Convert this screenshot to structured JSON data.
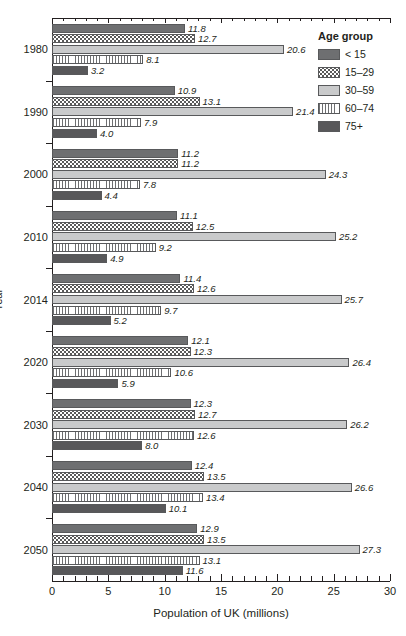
{
  "chart_data": {
    "type": "bar",
    "orientation": "horizontal",
    "grouped": true,
    "title": "",
    "xlabel": "Population of UK (millions)",
    "ylabel": "Year",
    "xlim": [
      0,
      30
    ],
    "xticks": [
      0,
      5,
      10,
      15,
      20,
      25,
      30
    ],
    "xtick_labels": [
      "0",
      "5",
      "10",
      "15",
      "20",
      "25",
      "30"
    ],
    "minor_tick_step": 1,
    "grid": false,
    "legend_title": "Age group",
    "legend_position": "top-right",
    "categories": [
      "1980",
      "1990",
      "2000",
      "2010",
      "2014",
      "2020",
      "2030",
      "2040",
      "2050"
    ],
    "series": [
      {
        "name": "< 15",
        "fill": "dark-gray-solid",
        "color": "#6e6f71",
        "values": [
          11.8,
          10.9,
          11.2,
          11.1,
          11.4,
          12.1,
          12.3,
          12.4,
          12.9
        ]
      },
      {
        "name": "15–29",
        "fill": "white-dotted",
        "color": "#ffffff",
        "values": [
          12.7,
          13.1,
          11.2,
          12.5,
          12.6,
          12.3,
          12.7,
          13.5,
          13.5
        ]
      },
      {
        "name": "30–59",
        "fill": "light-gray-solid",
        "color": "#c9cacb",
        "values": [
          20.6,
          21.4,
          24.3,
          25.2,
          25.7,
          26.4,
          26.2,
          26.6,
          27.3
        ]
      },
      {
        "name": "60–74",
        "fill": "white-vertical-lines",
        "color": "#ffffff",
        "values": [
          8.1,
          7.9,
          7.8,
          9.2,
          9.7,
          10.6,
          12.6,
          13.4,
          13.1
        ]
      },
      {
        "name": "75+",
        "fill": "darker-gray-solid",
        "color": "#58585a",
        "values": [
          3.2,
          4.0,
          4.4,
          4.9,
          5.2,
          5.9,
          8.0,
          10.1,
          11.6
        ]
      }
    ],
    "bar_labels": [
      [
        "11.8",
        "12.7",
        "20.6",
        "8.1",
        "3.2"
      ],
      [
        "10.9",
        "13.1",
        "21.4",
        "7.9",
        "4.0"
      ],
      [
        "11.2",
        "11.2",
        "24.3",
        "7.8",
        "4.4"
      ],
      [
        "11.1",
        "12.5",
        "25.2",
        "9.2",
        "4.9"
      ],
      [
        "11.4",
        "12.6",
        "25.7",
        "9.7",
        "5.2"
      ],
      [
        "12.1",
        "12.3",
        "26.4",
        "10.6",
        "5.9"
      ],
      [
        "12.3",
        "12.7",
        "26.2",
        "12.6",
        "8.0"
      ],
      [
        "12.4",
        "13.5",
        "26.6",
        "13.4",
        "10.1"
      ],
      [
        "12.9",
        "13.5",
        "27.3",
        "13.1",
        "11.6"
      ]
    ]
  },
  "legend": {
    "title": "Age group",
    "items": [
      {
        "label": "< 15"
      },
      {
        "label": "15–29"
      },
      {
        "label": "30–59"
      },
      {
        "label": "60–74"
      },
      {
        "label": "75+"
      }
    ]
  },
  "axes": {
    "x_title": "Population of UK (millions)",
    "y_title": "Year"
  }
}
